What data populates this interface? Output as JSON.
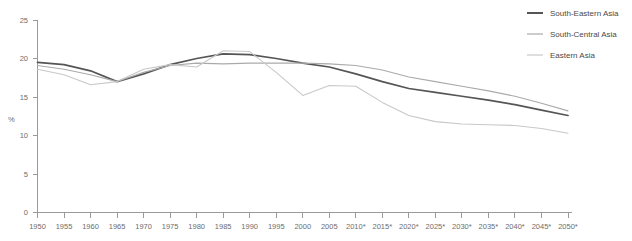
{
  "chart_data": {
    "type": "line",
    "title": "",
    "xlabel": "",
    "ylabel": "%",
    "ylim": [
      0,
      25
    ],
    "yticks": [
      0,
      5,
      10,
      15,
      20,
      25
    ],
    "grid": false,
    "legend_position": "top-right",
    "categories": [
      "1950",
      "1955",
      "1960",
      "1965",
      "1970",
      "1975",
      "1980",
      "1985",
      "1990",
      "1995",
      "2000",
      "2005",
      "2010*",
      "2015*",
      "2020*",
      "2025*",
      "2030*",
      "2035*",
      "2040*",
      "2045*",
      "2050*"
    ],
    "x": [
      1950,
      1955,
      1960,
      1965,
      1970,
      1975,
      1980,
      1985,
      1990,
      1995,
      2000,
      2005,
      2010,
      2015,
      2020,
      2025,
      2030,
      2035,
      2040,
      2045,
      2050
    ],
    "series": [
      {
        "name": "South-Eastern Asia",
        "color": "#555555",
        "values": [
          19.5,
          19.2,
          18.4,
          17.0,
          18.0,
          19.2,
          20.0,
          20.6,
          20.5,
          20.0,
          19.4,
          18.9,
          18.0,
          17.0,
          16.1,
          15.6,
          15.1,
          14.6,
          14.0,
          13.3,
          12.6
        ]
      },
      {
        "name": "South-Central Asia",
        "color": "#aaaaaa",
        "values": [
          19.1,
          18.6,
          17.9,
          17.0,
          18.2,
          19.1,
          19.4,
          19.3,
          19.4,
          19.4,
          19.4,
          19.3,
          19.1,
          18.5,
          17.6,
          17.0,
          16.4,
          15.8,
          15.1,
          14.2,
          13.2
        ]
      },
      {
        "name": "Eastern Asia",
        "color": "#c8c8c8",
        "values": [
          18.6,
          17.9,
          16.6,
          17.0,
          18.6,
          19.2,
          18.9,
          21.0,
          20.9,
          18.2,
          15.2,
          16.5,
          16.4,
          14.3,
          12.6,
          11.8,
          11.5,
          11.4,
          11.3,
          10.9,
          10.3
        ]
      }
    ]
  },
  "legend": {
    "items": [
      {
        "label": "South-Eastern Asia"
      },
      {
        "label": "South-Central Asia"
      },
      {
        "label": "Eastern Asia"
      }
    ]
  }
}
